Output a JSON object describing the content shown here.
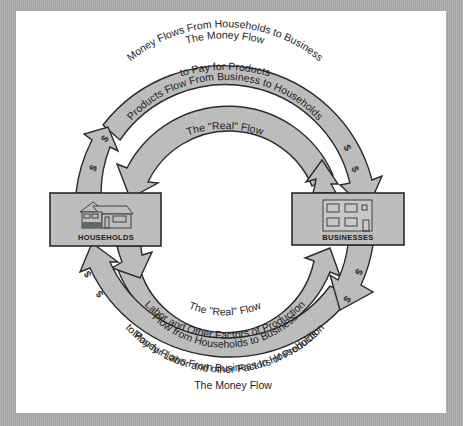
{
  "diagram": {
    "type": "circular-flow",
    "nodes": {
      "households": {
        "label": "HOUSEHOLDS",
        "icon": "house-icon"
      },
      "businesses": {
        "label": "BUSINESSES",
        "icon": "office-building-icon"
      }
    },
    "top": {
      "outer_title": "The Money Flow",
      "outer_band_line1": "Money Flows From Households to Business",
      "outer_band_line2": "to Pay for Products",
      "inner_band": "Products Flow From Business to Households",
      "inner_title": "The \"Real\" Flow"
    },
    "bottom": {
      "inner_title": "The \"Real\" Flow",
      "inner_band_line1": "Labor and Other Factors of Production",
      "inner_band_line2": "Flow from Households to Business",
      "outer_band_line1": "Money Flows From Business to Households",
      "outer_band_line2": "to Pay for Labor and other Factors of Production",
      "outer_title": "The Money Flow"
    },
    "money_symbol": "$",
    "colors": {
      "band_fill": "#bcbcbc",
      "box_fill": "#bdbdbd",
      "outline": "#2a2a2a",
      "panel": "#ffffff",
      "frame": "#a9a9a9"
    }
  }
}
